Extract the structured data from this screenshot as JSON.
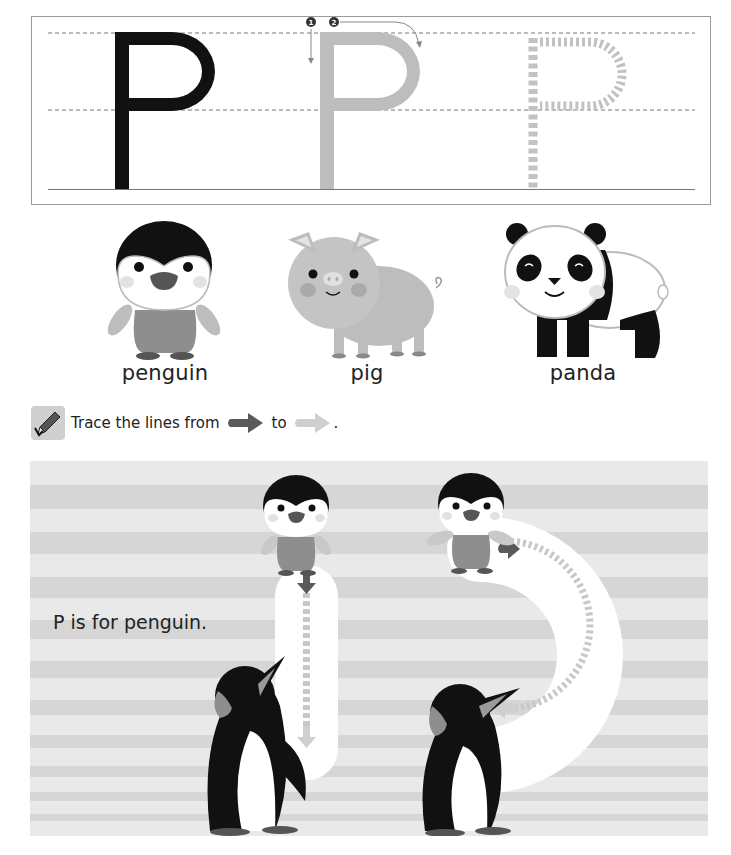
{
  "letter_trace": {
    "letters": [
      {
        "char": "P",
        "style": "solid-black",
        "color": "#111111"
      },
      {
        "char": "P",
        "style": "solid-gray-guide",
        "color": "#bdbdbd"
      },
      {
        "char": "P",
        "style": "dotted-trace",
        "color": "#c2c2c2"
      }
    ],
    "stroke_order": [
      "❶",
      "❷"
    ],
    "guide_lines": [
      "top-dashed",
      "middle-dashed",
      "baseline"
    ]
  },
  "animals": [
    {
      "name": "penguin",
      "label": "penguin"
    },
    {
      "name": "pig",
      "label": "pig"
    },
    {
      "name": "panda",
      "label": "panda"
    }
  ],
  "instruction": {
    "icon": "pencil-icon",
    "text_before": "Trace the lines from",
    "text_middle": "to",
    "text_after": ".",
    "start_arrow_color": "#5a5a5a",
    "end_arrow_color": "#cfcfcf"
  },
  "practice": {
    "caption": "P is for penguin.",
    "stroke_1": "vertical-down",
    "stroke_2": "curve-right-to-left",
    "stripe_light": "#e8e8e8",
    "stripe_dark": "#d5d5d5"
  },
  "colors": {
    "black_letter": "#111111",
    "gray_letter": "#bdbdbd",
    "dotted_letter": "#c2c2c2",
    "arrow_dark": "#5a5a5a",
    "arrow_light": "#cfcfcf"
  }
}
